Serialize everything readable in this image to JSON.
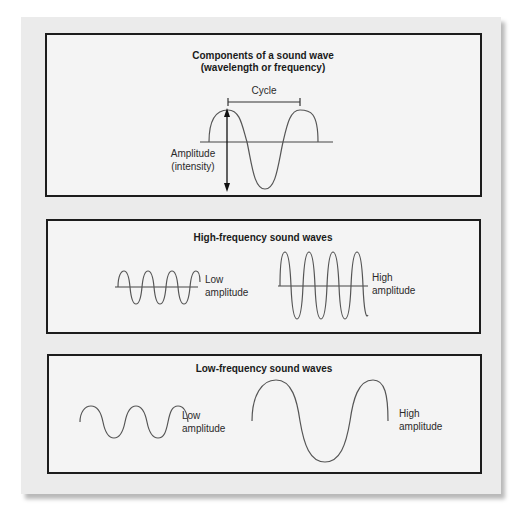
{
  "figure": {
    "panels": [
      {
        "id": "components",
        "title_line1": "Components of a sound wave",
        "title_line2": "(wavelength or frequency)",
        "cycle_label": "Cycle",
        "amplitude_label_line1": "Amplitude",
        "amplitude_label_line2": "(intensity)"
      },
      {
        "id": "high-frequency",
        "title": "High-frequency sound waves",
        "waves": [
          {
            "label_line1": "Low",
            "label_line2": "amplitude",
            "cycles": 4
          },
          {
            "label_line1": "High",
            "label_line2": "amplitude",
            "cycles": 4
          }
        ]
      },
      {
        "id": "low-frequency",
        "title": "Low-frequency sound waves",
        "waves": [
          {
            "label_line1": "Low",
            "label_line2": "amplitude",
            "cycles": 2.5
          },
          {
            "label_line1": "High",
            "label_line2": "amplitude",
            "cycles": 1.5
          }
        ]
      }
    ],
    "colors": {
      "paper": "#ebebeb",
      "panel": "#f4f4f4",
      "border": "#1c1c1c",
      "wave": "#555555",
      "text": "#1a1a1a"
    }
  }
}
